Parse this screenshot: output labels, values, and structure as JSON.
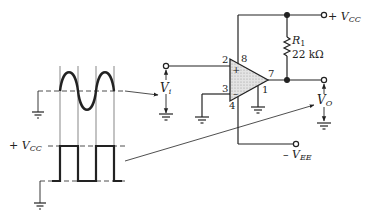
{
  "diagram": {
    "type": "op-amp comparator circuit with waveforms",
    "supply_positive": {
      "prefix": "+ ",
      "symbol": "V",
      "subscript": "CC"
    },
    "supply_negative": {
      "prefix": "– ",
      "symbol": "V",
      "subscript": "EE"
    },
    "resistor": {
      "name_symbol": "R",
      "name_subscript": "1",
      "value": "22 kΩ"
    },
    "pins": {
      "noninverting": "2",
      "inverting": "3",
      "v_plus": "8",
      "v_minus": "4",
      "output": "7",
      "ground": "1"
    },
    "opamp_input_marks": {
      "plus": "+",
      "minus": "–"
    },
    "input_label": {
      "symbol": "V",
      "subscript": "i"
    },
    "output_label": {
      "symbol": "V",
      "subscript": "O"
    },
    "waveform_square_level_label": {
      "prefix": "+ ",
      "symbol": "V",
      "subscript": "CC"
    },
    "waveforms": [
      {
        "name": "input-sine",
        "shape": "sine",
        "cycles": 2
      },
      {
        "name": "output-square",
        "shape": "square",
        "pulses": 2,
        "high": "+VCC",
        "low": "0"
      }
    ]
  }
}
